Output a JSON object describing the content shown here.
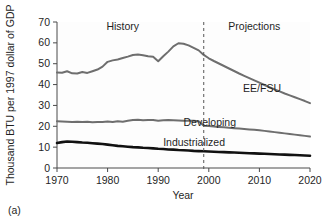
{
  "panel": {
    "label": "(a)"
  },
  "chart_data": {
    "type": "line",
    "title": "",
    "xlabel": "Year",
    "ylabel": "Thousand BTU per 1997 dollar of GDP",
    "xlim": [
      1970,
      2020
    ],
    "ylim": [
      0,
      70
    ],
    "xticks": [
      1970,
      1980,
      1990,
      2000,
      2010,
      2020
    ],
    "xticklabels": [
      "1970",
      "1980",
      "1990",
      "2000",
      "2010",
      "2020"
    ],
    "yticks": [
      0,
      10,
      20,
      30,
      40,
      50,
      60,
      70
    ],
    "yticklabels": [
      "0",
      "10",
      "20",
      "30",
      "40",
      "50",
      "60",
      "70"
    ],
    "grid": false,
    "legend": "inline-labels-right",
    "annotations": [
      {
        "text": "History",
        "x": 1983,
        "y": 66,
        "name": "history-annotation"
      },
      {
        "text": "Projections",
        "x": 2009,
        "y": 66,
        "name": "projections-annotation"
      }
    ],
    "divider": {
      "x": 1999,
      "style": "dashed",
      "label": "history-projection-divider"
    },
    "x": [
      1970,
      1971,
      1972,
      1973,
      1974,
      1975,
      1976,
      1977,
      1978,
      1979,
      1980,
      1981,
      1982,
      1983,
      1984,
      1985,
      1986,
      1987,
      1988,
      1989,
      1990,
      1991,
      1992,
      1993,
      1994,
      1995,
      1996,
      1997,
      1998,
      1999,
      2000,
      2001,
      2002,
      2003,
      2004,
      2005,
      2006,
      2007,
      2008,
      2009,
      2010,
      2011,
      2012,
      2013,
      2014,
      2015,
      2016,
      2017,
      2018,
      2019,
      2020
    ],
    "series": [
      {
        "name": "EE/FSU",
        "color": "#6e6e6e",
        "width": 2.0,
        "values": [
          45.8,
          45.7,
          46.4,
          45.4,
          45.3,
          46.0,
          45.6,
          46.4,
          47.2,
          48.6,
          50.9,
          51.6,
          52.0,
          52.7,
          53.4,
          54.2,
          54.4,
          54.1,
          53.6,
          53.3,
          51.2,
          53.6,
          55.8,
          58.3,
          59.8,
          59.6,
          58.8,
          57.6,
          56.4,
          54.2,
          52.6,
          51.3,
          50.1,
          48.9,
          47.7,
          46.5,
          45.3,
          44.2,
          43.1,
          42.0,
          40.9,
          39.8,
          38.7,
          37.7,
          36.7,
          35.7,
          34.8,
          33.9,
          33.0,
          32.1,
          31.1
        ]
      },
      {
        "name": "Developing",
        "color": "#6e6e6e",
        "width": 2.0,
        "values": [
          22.4,
          22.3,
          22.2,
          22.1,
          22.2,
          22.0,
          22.2,
          21.9,
          22.1,
          22.0,
          22.3,
          22.0,
          22.4,
          22.2,
          22.6,
          23.0,
          23.1,
          22.9,
          23.0,
          23.0,
          22.6,
          22.9,
          23.0,
          22.9,
          22.8,
          22.7,
          22.7,
          22.6,
          22.4,
          20.3,
          20.1,
          19.9,
          19.7,
          19.5,
          19.3,
          19.1,
          18.9,
          18.7,
          18.5,
          18.3,
          18.1,
          17.8,
          17.5,
          17.2,
          16.9,
          16.6,
          16.3,
          16.0,
          15.7,
          15.4,
          15.1
        ]
      },
      {
        "name": "Industrialized",
        "color": "#111111",
        "width": 2.6,
        "values": [
          12.0,
          12.4,
          12.7,
          12.6,
          12.4,
          12.2,
          12.1,
          11.9,
          11.7,
          11.5,
          11.2,
          10.9,
          10.6,
          10.4,
          10.2,
          10.0,
          9.9,
          9.7,
          9.6,
          9.4,
          9.2,
          9.1,
          8.9,
          8.8,
          8.6,
          8.5,
          8.4,
          8.2,
          8.1,
          8.0,
          7.9,
          7.8,
          7.7,
          7.6,
          7.5,
          7.4,
          7.3,
          7.2,
          7.1,
          7.0,
          6.9,
          6.8,
          6.7,
          6.6,
          6.5,
          6.4,
          6.3,
          6.2,
          6.1,
          6.0,
          5.9
        ]
      }
    ],
    "series_label_positions": [
      {
        "name": "EE/FSU",
        "x": 281,
        "y": 92
      },
      {
        "name": "Developing",
        "x": 236,
        "y": 126
      },
      {
        "name": "Industrialized",
        "x": 225,
        "y": 146
      }
    ]
  }
}
